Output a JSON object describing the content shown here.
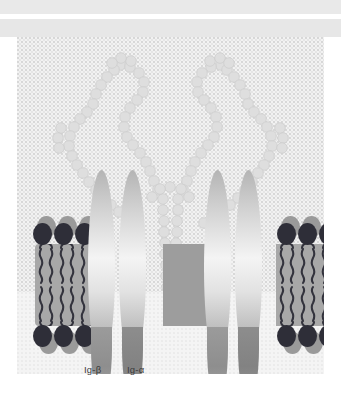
{
  "figure": {
    "header_faint_text": "",
    "background_color": "#f2f2f2",
    "panel_color": "#f2f2f2"
  },
  "labels": {
    "ig_beta": "Ig-β",
    "ig_alpha": "Ig-α"
  },
  "membrane": {
    "bilayer_color": "#a8a8a8",
    "bilayer_center_color": "#9d9d9d",
    "head_dark_color": "#2e2e38",
    "head_shadow_color": "#9a9a9a",
    "tail_color": "#33333d",
    "leaflets": [
      "outer",
      "inner"
    ],
    "patches": [
      {
        "name": "left-patch",
        "x": 18,
        "y": 207,
        "width": 64,
        "height": 82,
        "lipid_columns": 3
      },
      {
        "name": "center-patch",
        "x": 146,
        "y": 207,
        "width": 50,
        "height": 82,
        "lipid_columns": 0
      },
      {
        "name": "right-patch",
        "x": 259,
        "y": 207,
        "width": 64,
        "height": 82,
        "lipid_columns": 3
      }
    ]
  },
  "subunits": [
    {
      "name": "ig-beta-left",
      "label": "",
      "x": 88,
      "cx": 101,
      "top": 170,
      "bottom": 363,
      "width": 27
    },
    {
      "name": "ig-alpha-left",
      "label": "",
      "x": 119,
      "cx": 132,
      "top": 170,
      "bottom": 363,
      "width": 27
    },
    {
      "name": "ig-alpha-right",
      "label": "",
      "x": 204,
      "cx": 217,
      "top": 170,
      "bottom": 363,
      "width": 27
    },
    {
      "name": "ig-beta-right",
      "label": "",
      "x": 235,
      "cx": 248,
      "top": 170,
      "bottom": 363,
      "width": 27
    }
  ],
  "receptor": {
    "name": "membrane-immunoglobulin",
    "shape": "Y",
    "bead_color": "#dedede",
    "bead_stroke": "#cccccc",
    "arms": [
      "left-fab-arm",
      "right-fab-arm"
    ],
    "stem": "fc-stem-transmembrane"
  }
}
